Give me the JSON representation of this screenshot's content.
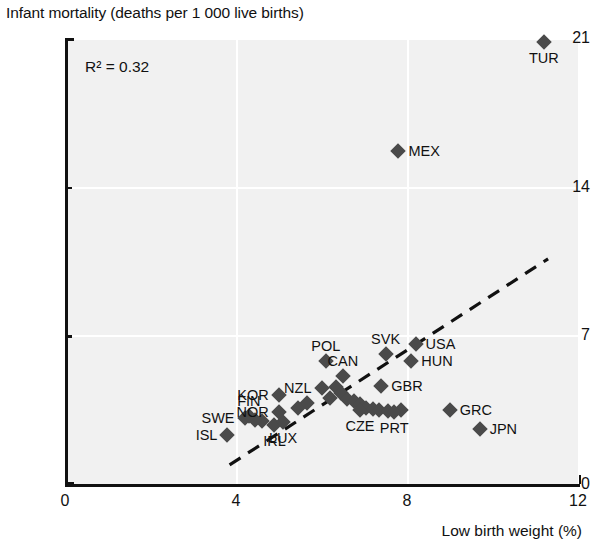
{
  "chart_data": {
    "type": "scatter",
    "title": "Infant mortality (deaths per 1 000 live births)",
    "xlabel": "Low birth weight (%)",
    "ylabel": "Infant mortality (deaths per 1 000 live births)",
    "xlim": [
      0,
      12
    ],
    "ylim": [
      0,
      21
    ],
    "xticks": [
      "0",
      "4",
      "8",
      "12"
    ],
    "yticks": [
      "0",
      "7",
      "14",
      "21"
    ],
    "grid": true,
    "legend": null,
    "annotations": [
      {
        "name": "r2",
        "text": "R² = 0.32",
        "value": 0.32
      }
    ],
    "trendline": {
      "style": "dashed",
      "x_start": 3.85,
      "y_start": 0.9,
      "x_end": 11.3,
      "y_end": 10.6
    },
    "points": [
      {
        "label": "ISL",
        "x": 3.8,
        "y": 2.3,
        "label_pos": "left"
      },
      {
        "label": "SWE",
        "x": 4.2,
        "y": 3.1,
        "label_pos": "left"
      },
      {
        "label": "FIN",
        "x": 4.3,
        "y": 3.2,
        "label_pos": "above"
      },
      {
        "label": "NOR",
        "x": 5.0,
        "y": 3.4,
        "label_pos": "left"
      },
      {
        "label": "IRL",
        "x": 4.9,
        "y": 2.8,
        "label_pos": "below"
      },
      {
        "label": "LUX",
        "x": 5.1,
        "y": 2.9,
        "label_pos": "below"
      },
      {
        "label": "KOR",
        "x": 5.0,
        "y": 4.2,
        "label_pos": "left"
      },
      {
        "label": "NZL",
        "x": 6.0,
        "y": 4.5,
        "label_pos": "left"
      },
      {
        "label": "POL",
        "x": 6.1,
        "y": 5.8,
        "label_pos": "above"
      },
      {
        "label": "CAN",
        "x": 6.5,
        "y": 5.1,
        "label_pos": "above"
      },
      {
        "label": "CZE",
        "x": 6.9,
        "y": 3.5,
        "label_pos": "below"
      },
      {
        "label": "PRT",
        "x": 7.7,
        "y": 3.4,
        "label_pos": "below"
      },
      {
        "label": "GBR",
        "x": 7.4,
        "y": 4.6,
        "label_pos": "right"
      },
      {
        "label": "SVK",
        "x": 7.5,
        "y": 6.1,
        "label_pos": "above"
      },
      {
        "label": "USA",
        "x": 8.2,
        "y": 6.6,
        "label_pos": "right"
      },
      {
        "label": "HUN",
        "x": 8.1,
        "y": 5.8,
        "label_pos": "right"
      },
      {
        "label": "GRC",
        "x": 9.0,
        "y": 3.5,
        "label_pos": "right"
      },
      {
        "label": "JPN",
        "x": 9.7,
        "y": 2.6,
        "label_pos": "right"
      },
      {
        "label": "MEX",
        "x": 7.8,
        "y": 15.7,
        "label_pos": "right"
      },
      {
        "label": "TUR",
        "x": 11.2,
        "y": 20.8,
        "label_pos": "below"
      }
    ],
    "extra_markers": [
      {
        "x": 6.35,
        "y": 4.55
      },
      {
        "x": 6.45,
        "y": 4.3
      },
      {
        "x": 6.6,
        "y": 4.0
      },
      {
        "x": 6.75,
        "y": 3.9
      },
      {
        "x": 6.9,
        "y": 3.75
      },
      {
        "x": 7.05,
        "y": 3.6
      },
      {
        "x": 7.2,
        "y": 3.55
      },
      {
        "x": 7.35,
        "y": 3.5
      },
      {
        "x": 7.55,
        "y": 3.45
      },
      {
        "x": 7.85,
        "y": 3.5
      },
      {
        "x": 5.65,
        "y": 3.8
      },
      {
        "x": 5.45,
        "y": 3.6
      },
      {
        "x": 4.6,
        "y": 2.95
      },
      {
        "x": 4.45,
        "y": 3.0
      },
      {
        "x": 6.2,
        "y": 4.05
      }
    ]
  }
}
